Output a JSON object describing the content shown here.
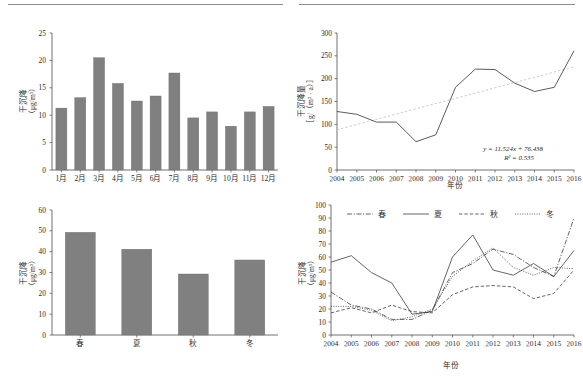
{
  "figure": {
    "background": "#ffffff",
    "bar_color": "#808080",
    "line_color": "#3d3d3d",
    "trend_color": "#c3c3c3"
  },
  "chart_data": [
    {
      "id": "monthly-dry-deposition",
      "type": "bar",
      "title": "",
      "xlabel": "",
      "ylabel": "干沉降（μg/m³）",
      "ylabel_main": "干沉降",
      "ylabel_unit": "（μg/m³）",
      "categories": [
        "1月",
        "2月",
        "3月",
        "4月",
        "5月",
        "6月",
        "7月",
        "8月",
        "9月",
        "10月",
        "11月",
        "12月"
      ],
      "values": [
        11.3,
        13.2,
        20.5,
        15.8,
        12.6,
        13.5,
        17.7,
        9.5,
        10.6,
        8.0,
        10.6,
        11.6
      ],
      "ylim": [
        0,
        25
      ],
      "yticks": [
        0,
        5,
        10,
        15,
        20,
        25
      ],
      "grid": false,
      "legend": "none"
    },
    {
      "id": "annual-dry-deposition-flux",
      "type": "line",
      "title": "",
      "xlabel": "年份",
      "ylabel": "干沉降量［g/（m² · a）］",
      "ylabel_main": "干沉降量",
      "ylabel_unit": "［g/（m² · a）］",
      "categories": [
        "2004",
        "2005",
        "2006",
        "2007",
        "2008",
        "2009",
        "2010",
        "2011",
        "2012",
        "2013",
        "2014",
        "2015",
        "2016"
      ],
      "values": [
        128,
        122,
        105,
        105,
        62,
        77,
        181,
        221,
        220,
        190,
        172,
        181,
        261
      ],
      "ylim": [
        0,
        300
      ],
      "yticks": [
        0,
        50,
        100,
        150,
        200,
        250,
        300
      ],
      "grid": false,
      "legend": "none",
      "annotations": {
        "equation": "y = 11.524x + 76.438",
        "r_squared": "R² = 0.535",
        "trend_start": 88,
        "trend_end": 226
      }
    },
    {
      "id": "seasonal-dry-deposition",
      "type": "bar",
      "title": "",
      "xlabel": "",
      "ylabel": "干沉降（μg/m³）",
      "ylabel_main": "干沉降",
      "ylabel_unit": "（μg/m³）",
      "categories": [
        "春",
        "夏",
        "秋",
        "冬"
      ],
      "values": [
        49.3,
        41.2,
        29.3,
        36.0
      ],
      "ylim": [
        0,
        60
      ],
      "yticks": [
        0,
        10,
        20,
        30,
        40,
        50,
        60
      ],
      "grid": false,
      "legend": "none"
    },
    {
      "id": "seasonal-trend-by-year",
      "type": "line",
      "title": "",
      "xlabel": "年份",
      "ylabel": "干沉降（μg/m³）",
      "ylabel_main": "干沉降",
      "ylabel_unit": "（μg/m³）",
      "categories": [
        "2004",
        "2005",
        "2006",
        "2007",
        "2008",
        "2009",
        "2010",
        "2011",
        "2012",
        "2013",
        "2014",
        "2015",
        "2016"
      ],
      "ylim": [
        0,
        100
      ],
      "yticks": [
        0,
        10,
        20,
        30,
        40,
        50,
        60,
        70,
        80,
        90,
        100
      ],
      "grid": false,
      "legend": "top",
      "series": [
        {
          "name": "春",
          "style": "dash-dot",
          "values": [
            33,
            23,
            20,
            12,
            12,
            19,
            48,
            55,
            66,
            62,
            52,
            45,
            90
          ]
        },
        {
          "name": "夏",
          "style": "solid",
          "values": [
            56,
            61,
            48,
            40,
            16,
            18,
            60,
            77,
            50,
            46,
            55,
            45,
            65
          ]
        },
        {
          "name": "秋",
          "style": "dashed",
          "values": [
            17,
            21,
            17,
            23,
            18,
            17,
            31,
            37,
            38,
            37,
            28,
            32,
            50
          ]
        },
        {
          "name": "冬",
          "style": "dotted",
          "values": [
            22,
            22,
            19,
            11,
            14,
            20,
            45,
            57,
            67,
            52,
            46,
            52,
            51
          ]
        }
      ]
    }
  ]
}
